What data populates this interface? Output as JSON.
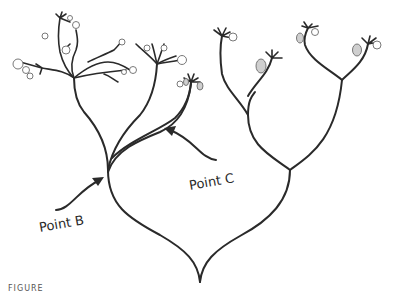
{
  "figure": {
    "type": "phylogenetic-tree-diagram",
    "labels": {
      "point_b": "Point B",
      "point_c": "Point C"
    },
    "caption_visible": "FIGURE",
    "colors": {
      "line": "#2a2a2a",
      "fruit_outline": "#6a6a6a",
      "pear_fill": "#cfcfcf",
      "background": "#ffffff"
    },
    "clades": [
      {
        "name": "left-clade",
        "fruit_type": "round-fruit",
        "annotated_node": "Point B"
      },
      {
        "name": "middle-branch",
        "fruit_type": "mixed-fruit",
        "annotated_node": "Point C"
      },
      {
        "name": "right-clade",
        "fruit_type": "pear-and-round-fruit"
      }
    ]
  }
}
